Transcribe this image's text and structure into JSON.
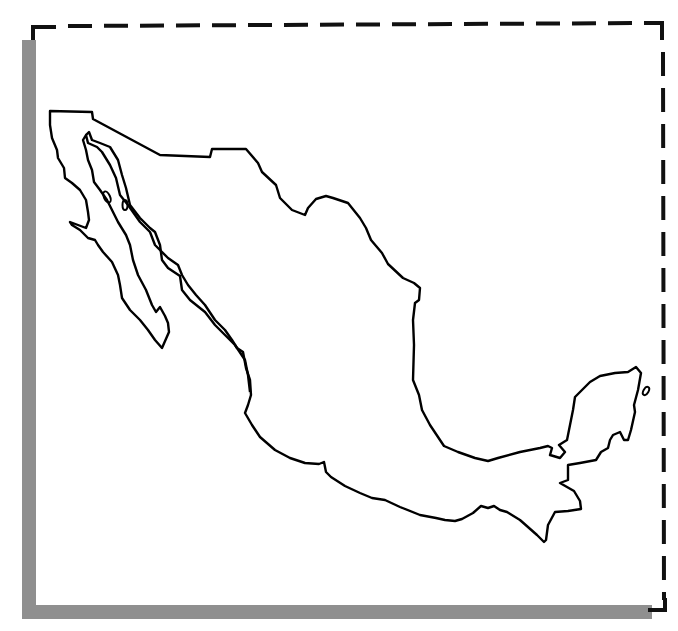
{
  "figure": {
    "type": "outline-map",
    "style": "blank outline map with dashed border and drop shadow",
    "colors": {
      "outline": "#000000",
      "background": "#ffffff",
      "shadow": "#8f8f8f",
      "border": "#111111"
    },
    "features": [
      {
        "name": "mainland-mexico",
        "kind": "landmass"
      },
      {
        "name": "baja-california-peninsula",
        "kind": "peninsula"
      },
      {
        "name": "yucatan-peninsula",
        "kind": "peninsula"
      },
      {
        "name": "gulf-islands",
        "kind": "island"
      },
      {
        "name": "cozumel-island",
        "kind": "island"
      }
    ]
  }
}
